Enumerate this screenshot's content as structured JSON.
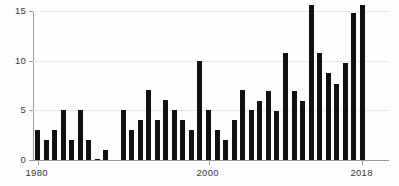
{
  "chart_data": {
    "type": "bar",
    "title": "",
    "subtitle": "",
    "xlabel": "",
    "ylabel": "",
    "xlim": [
      1979.5,
      2018.5
    ],
    "ylim": [
      0,
      15.8
    ],
    "grid": true,
    "legend": null,
    "y_ticks": [
      0,
      5,
      10,
      15
    ],
    "y_tick_labels": [
      "0",
      "5",
      "10",
      "15"
    ],
    "x_ticks": [
      1980,
      2000,
      2018
    ],
    "x_tick_labels": [
      "1980",
      "2000",
      "2018"
    ],
    "bar_color": "#111111",
    "axis_color": "#9a9a96",
    "grid_color": "#e9e9e6",
    "background_color": "#fdfdfc",
    "categories": [
      1980,
      1981,
      1982,
      1983,
      1984,
      1985,
      1986,
      1987,
      1988,
      1989,
      1990,
      1991,
      1992,
      1993,
      1994,
      1995,
      1996,
      1997,
      1998,
      1999,
      2000,
      2001,
      2002,
      2003,
      2004,
      2005,
      2006,
      2007,
      2008,
      2009,
      2010,
      2011,
      2012,
      2013,
      2014,
      2015,
      2016,
      2017,
      2018
    ],
    "values": [
      3,
      2,
      3,
      5,
      2,
      5,
      2,
      0.1,
      1,
      0,
      5,
      3,
      4,
      7,
      4,
      6,
      5,
      4,
      3,
      10,
      5,
      3,
      2,
      4,
      7,
      5,
      5.9,
      6.9,
      4.9,
      10.8,
      6.9,
      5.9,
      15.6,
      10.8,
      8.8,
      7.7,
      9.8,
      14.8,
      15.6
    ]
  }
}
